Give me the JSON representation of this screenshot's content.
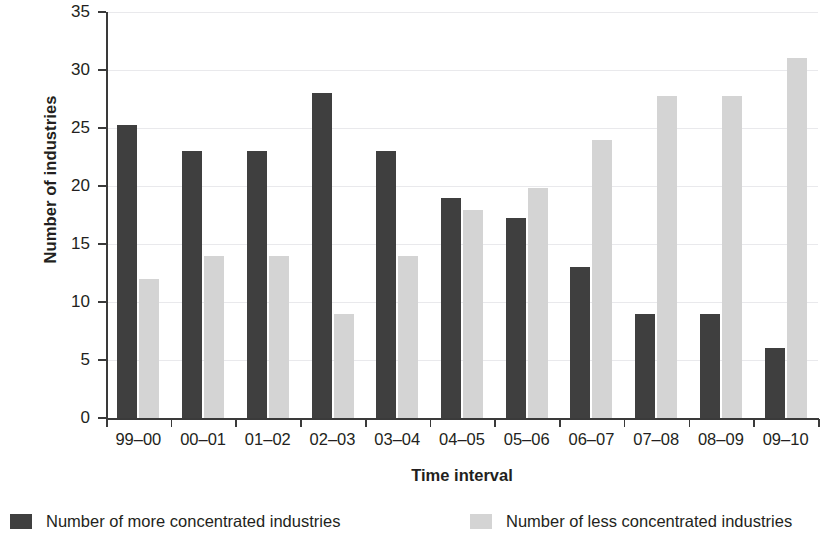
{
  "chart_data": {
    "type": "bar",
    "title": "",
    "xlabel": "Time interval",
    "ylabel": "Number of industries",
    "ylim": [
      0,
      35
    ],
    "ytick_labels": [
      "0",
      "5",
      "10",
      "15",
      "20",
      "25",
      "30",
      "35"
    ],
    "ytick_values": [
      0,
      5,
      10,
      15,
      20,
      25,
      30,
      35
    ],
    "grid": true,
    "legend_position": "bottom",
    "categories": [
      "99–00",
      "00–01",
      "01–02",
      "02–03",
      "03–04",
      "04–05",
      "05–06",
      "06–07",
      "07–08",
      "08–09",
      "09–10"
    ],
    "series": [
      {
        "name": "Number of more concentrated industries",
        "color": "#3f3f3f",
        "values": [
          25.3,
          23,
          23,
          28,
          23,
          19,
          17.2,
          13,
          9,
          9,
          6
        ]
      },
      {
        "name": "Number of less concentrated industries",
        "color": "#d4d4d4",
        "values": [
          12,
          14,
          14,
          9,
          14,
          17.9,
          19.8,
          24,
          27.8,
          27.8,
          31
        ]
      }
    ]
  },
  "legend": {
    "entries": [
      {
        "label": "Number of more concentrated industries",
        "swatch": "dark"
      },
      {
        "label": "Number of less concentrated industries",
        "swatch": "light"
      }
    ]
  },
  "axes": {
    "y_title": "Number of industries",
    "x_title": "Time interval"
  }
}
